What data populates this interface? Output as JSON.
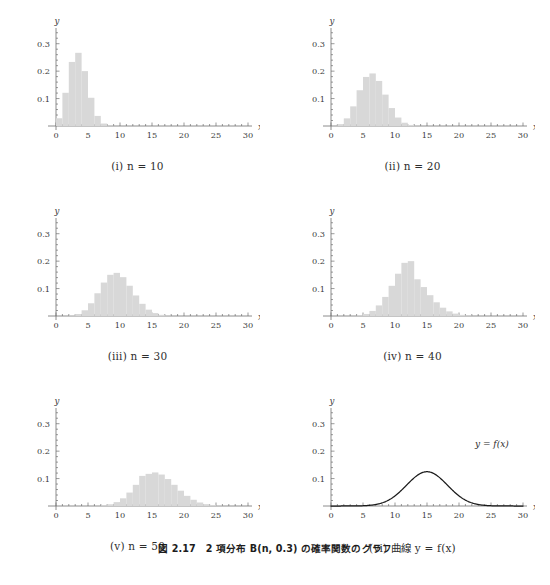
{
  "figure": {
    "caption": "図 2.17　2 項分布 B(n, 0.3) の確率関数のグラフ",
    "caption_plain": "Figure 2.17 Graphs of the probability function of the binomial distribution B(n, 0.3)"
  },
  "axes": {
    "x_label": "x",
    "y_label": "y",
    "x_ticks": [
      "0",
      "5",
      "10",
      "15",
      "20",
      "25",
      "30"
    ],
    "x_tick_values": [
      0,
      5,
      10,
      15,
      20,
      25,
      30
    ],
    "y_ticks": [
      "0.1",
      "0.2",
      "0.3"
    ],
    "y_tick_values": [
      0.1,
      0.2,
      0.3
    ],
    "xlim": [
      0,
      30
    ],
    "ylim": [
      0,
      0.35
    ],
    "grid": false,
    "bar_color": "#d8d8d8",
    "curve_color": "#1a1a1a",
    "axis_color": "#6e6e6e"
  },
  "panels": [
    {
      "key": "i",
      "caption": "(i) n = 10",
      "label": "(i)",
      "n": 10
    },
    {
      "key": "ii",
      "caption": "(ii) n = 20",
      "label": "(ii)",
      "n": 20
    },
    {
      "key": "iii",
      "caption": "(iii) n = 30",
      "label": "(iii)",
      "n": 30
    },
    {
      "key": "iv",
      "caption": "(iv) n = 40",
      "label": "(iv)",
      "n": 40
    },
    {
      "key": "v",
      "caption": "(v) n = 50",
      "label": "(v)",
      "n": 50
    },
    {
      "key": "vi",
      "caption": "(vi) 曲線 y = f(x)",
      "label": "(vi)",
      "n": null,
      "annotation": "y = f(x)"
    }
  ],
  "chart_data": [
    {
      "type": "bar",
      "panel": "i",
      "title": "(i) n = 10",
      "distribution": "B(10, 0.3)",
      "xlabel": "x",
      "ylabel": "y",
      "xlim": [
        0,
        30
      ],
      "ylim": [
        0,
        0.35
      ],
      "x": [
        0,
        1,
        2,
        3,
        4,
        5,
        6,
        7,
        8,
        9,
        10
      ],
      "values": [
        0.0282,
        0.1211,
        0.2335,
        0.2668,
        0.2001,
        0.1029,
        0.0368,
        0.009,
        0.0014,
        0.0001,
        0.0
      ]
    },
    {
      "type": "bar",
      "panel": "ii",
      "title": "(ii) n = 20",
      "distribution": "B(20, 0.3)",
      "xlabel": "x",
      "ylabel": "y",
      "xlim": [
        0,
        30
      ],
      "ylim": [
        0,
        0.35
      ],
      "x": [
        0,
        1,
        2,
        3,
        4,
        5,
        6,
        7,
        8,
        9,
        10,
        11,
        12,
        13,
        14,
        15,
        16
      ],
      "values": [
        0.0008,
        0.0068,
        0.0278,
        0.0716,
        0.1304,
        0.1789,
        0.1916,
        0.1643,
        0.1144,
        0.0654,
        0.0308,
        0.012,
        0.0039,
        0.001,
        0.0002,
        0.0,
        0.0
      ]
    },
    {
      "type": "bar",
      "panel": "iii",
      "title": "(iii) n = 30",
      "distribution": "B(30, 0.3)",
      "xlabel": "x",
      "ylabel": "y",
      "xlim": [
        0,
        30
      ],
      "ylim": [
        0,
        0.35
      ],
      "x": [
        0,
        1,
        2,
        3,
        4,
        5,
        6,
        7,
        8,
        9,
        10,
        11,
        12,
        13,
        14,
        15,
        16,
        17,
        18,
        19,
        20,
        21
      ],
      "values": [
        0.0,
        0.0003,
        0.0018,
        0.0072,
        0.0208,
        0.0464,
        0.0829,
        0.1219,
        0.1501,
        0.1573,
        0.1416,
        0.1103,
        0.0749,
        0.0444,
        0.0231,
        0.0106,
        0.0042,
        0.0015,
        0.0005,
        0.0001,
        0.0,
        0.0
      ]
    },
    {
      "type": "bar",
      "panel": "iv",
      "title": "(iv) n = 40",
      "distribution": "B(40, 0.3)",
      "xlabel": "x",
      "ylabel": "y",
      "xlim": [
        0,
        30
      ],
      "ylim": [
        0,
        0.35
      ],
      "x": [
        0,
        1,
        2,
        3,
        4,
        5,
        6,
        7,
        8,
        9,
        10,
        11,
        12,
        13,
        14,
        15,
        16,
        17,
        18,
        19,
        20,
        21,
        22,
        23,
        24,
        25,
        26
      ],
      "values": [
        0.0,
        0.0,
        0.0001,
        0.0006,
        0.0024,
        0.0074,
        0.0185,
        0.0386,
        0.0696,
        0.11,
        0.1542,
        0.1938,
        0.2,
        0.1338,
        0.1055,
        0.0759,
        0.05,
        0.0303,
        0.0169,
        0.0087,
        0.0041,
        0.0018,
        0.0007,
        0.0003,
        0.0001,
        0.0,
        0.0
      ]
    },
    {
      "type": "bar",
      "panel": "v",
      "title": "(v) n = 50",
      "distribution": "B(50, 0.3)",
      "xlabel": "x",
      "ylabel": "y",
      "xlim": [
        0,
        30
      ],
      "ylim": [
        0,
        0.35
      ],
      "x": [
        0,
        1,
        2,
        3,
        4,
        5,
        6,
        7,
        8,
        9,
        10,
        11,
        12,
        13,
        14,
        15,
        16,
        17,
        18,
        19,
        20,
        21,
        22,
        23,
        24,
        25,
        26,
        27,
        28,
        29,
        30
      ],
      "values": [
        0.0,
        0.0,
        0.0,
        0.0,
        0.0001,
        0.0002,
        0.0008,
        0.0024,
        0.0063,
        0.0142,
        0.028,
        0.049,
        0.0771,
        0.1098,
        0.1172,
        0.1223,
        0.1147,
        0.0983,
        0.0772,
        0.0558,
        0.037,
        0.0227,
        0.0128,
        0.0067,
        0.0032,
        0.0014,
        0.0006,
        0.0002,
        0.0001,
        0.0,
        0.0
      ]
    },
    {
      "type": "line",
      "panel": "vi",
      "title": "(vi) 曲線 y = f(x)",
      "annotation": "y = f(x)",
      "xlabel": "x",
      "ylabel": "y",
      "xlim": [
        0,
        30
      ],
      "ylim": [
        0,
        0.35
      ],
      "curve": "normal",
      "mean": 15,
      "sd": 3.2,
      "peak": 0.125
    }
  ]
}
